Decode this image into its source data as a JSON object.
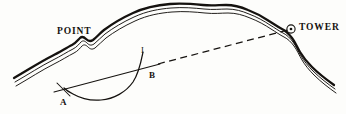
{
  "figure": {
    "kind": "surveying-coastline-diagram",
    "background_color": "#fdfdfb",
    "ink_color": "#15120f",
    "width": 346,
    "height": 114
  },
  "labels": {
    "point": "POINT",
    "tower": "TOWER",
    "station_a": "A",
    "station_b": "B",
    "curve_i": "I"
  },
  "markers": {
    "tower_station": "circle-dot-survey-marker"
  },
  "lines": {
    "sight_line_solid": "solid line from A through B",
    "sight_line_dashed": "dashed line from B to TOWER",
    "position_arc": "arc curve labelled I passing through A and B",
    "tick_at_a": "short cross tick at station A"
  },
  "coastline": {
    "description": "three parallel wavy shoreline traces forming a headland",
    "stroke_weights": [
      2.2,
      0.9,
      0.9
    ]
  }
}
